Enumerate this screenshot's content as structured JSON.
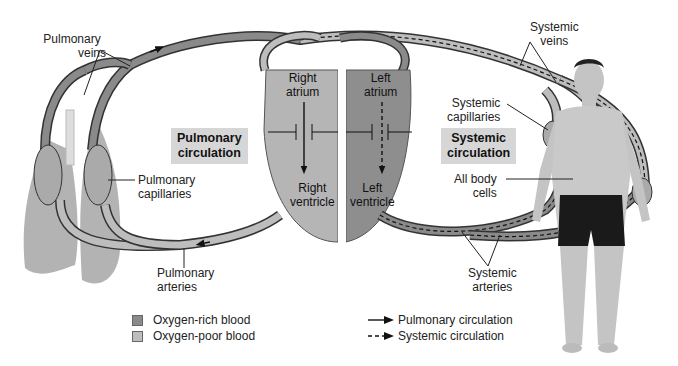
{
  "diagram": {
    "labels": {
      "pulmonary_veins": [
        "Pulmonary",
        "veins"
      ],
      "pulmonary_capillaries": [
        "Pulmonary",
        "capillaries"
      ],
      "pulmonary_arteries": [
        "Pulmonary",
        "arteries"
      ],
      "systemic_veins": [
        "Systemic",
        "veins"
      ],
      "systemic_capillaries": [
        "Systemic",
        "capillaries"
      ],
      "systemic_arteries": [
        "Systemic",
        "arteries"
      ],
      "all_body_cells": [
        "All body",
        "cells"
      ]
    },
    "boxes": {
      "pulmonary": [
        "Pulmonary",
        "circulation"
      ],
      "systemic": [
        "Systemic",
        "circulation"
      ]
    },
    "heart": {
      "right_atrium": [
        "Right",
        "atrium"
      ],
      "left_atrium": [
        "Left",
        "atrium"
      ],
      "right_ventricle": [
        "Right",
        "ventricle"
      ],
      "left_ventricle": [
        "Left",
        "ventricle"
      ]
    },
    "legend": {
      "oxygen_rich": "Oxygen-rich blood",
      "oxygen_poor": "Oxygen-poor blood",
      "pulmonary_circulation": "Pulmonary circulation",
      "systemic_circulation": "Systemic circulation"
    },
    "colors": {
      "oxygen_rich": "#8a8a8a",
      "oxygen_poor": "#bdbdbd",
      "vessel_outline": "#333333",
      "label_box": "#d6d6d6",
      "lung": "#9a9a9a",
      "skin": "#c9c9c9",
      "shorts": "#1a1a1a"
    }
  }
}
